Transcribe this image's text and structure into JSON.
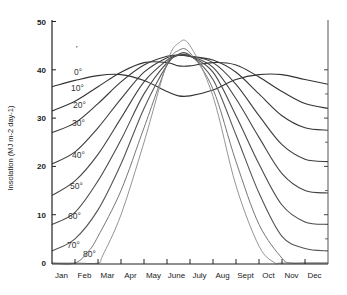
{
  "chart_data": {
    "type": "line",
    "title": "",
    "xlabel": "",
    "ylabel": "Insolation (MJ m-2 day-1)",
    "ylim": [
      0,
      50
    ],
    "yticks": [
      0,
      10,
      20,
      30,
      40,
      50
    ],
    "grid": false,
    "legend_position": "inline labels at left",
    "categories": [
      "Jan",
      "Feb",
      "Mar",
      "Apr",
      "May",
      "June",
      "July",
      "Aug",
      "Sept",
      "Oct",
      "Nov",
      "Dec"
    ],
    "x_note": "x values are month position (0 = start of Jan, 12 = end of Dec)",
    "series": [
      {
        "name": "0°",
        "x": [
          0,
          1,
          2,
          3,
          4,
          5,
          5.5,
          6,
          7,
          8,
          9,
          10,
          11,
          12
        ],
        "values": [
          36.5,
          37.8,
          38.8,
          39.0,
          37.8,
          35.5,
          34.6,
          34.6,
          35.8,
          38.0,
          39.0,
          39.0,
          38.0,
          37.0
        ]
      },
      {
        "name": "10°",
        "x": [
          0,
          1,
          2,
          3,
          4,
          5,
          5.5,
          6,
          7,
          8,
          9,
          10,
          11,
          12
        ],
        "values": [
          31.5,
          33.5,
          36.5,
          39.5,
          41.5,
          41.5,
          40.8,
          40.8,
          41.5,
          41.0,
          38.5,
          35.5,
          33.0,
          32.0
        ]
      },
      {
        "name": "20°",
        "x": [
          0,
          1,
          2,
          3,
          4,
          5,
          5.5,
          6,
          7,
          8,
          9,
          10,
          11,
          12
        ],
        "values": [
          27.0,
          29.0,
          33.0,
          37.5,
          41.0,
          42.8,
          43.0,
          42.8,
          42.0,
          39.5,
          35.0,
          30.5,
          28.0,
          27.5
        ]
      },
      {
        "name": "30°",
        "x": [
          0,
          1,
          2,
          3,
          4,
          5,
          5.5,
          6,
          7,
          8,
          9,
          10,
          11,
          12
        ],
        "values": [
          20.5,
          23.0,
          28.0,
          34.0,
          39.5,
          42.5,
          43.0,
          42.8,
          41.5,
          37.0,
          30.5,
          24.5,
          21.5,
          21.0
        ]
      },
      {
        "name": "40°",
        "x": [
          0,
          1,
          2,
          3,
          4,
          5,
          5.5,
          6,
          7,
          8,
          9,
          10,
          11,
          12
        ],
        "values": [
          14.0,
          17.0,
          22.5,
          30.0,
          37.5,
          42.0,
          43.0,
          42.8,
          40.5,
          34.0,
          26.0,
          18.5,
          15.0,
          14.5
        ]
      },
      {
        "name": "50°",
        "x": [
          0,
          1,
          2,
          3,
          4,
          5,
          5.5,
          6,
          7,
          8,
          9,
          10,
          11,
          12
        ],
        "values": [
          8.0,
          10.5,
          17.0,
          25.5,
          35.0,
          41.5,
          43.0,
          42.8,
          39.5,
          30.5,
          20.5,
          12.0,
          8.5,
          8.0
        ]
      },
      {
        "name": "60°",
        "x": [
          0,
          1,
          2,
          3,
          4,
          5,
          5.5,
          6,
          7,
          8,
          9,
          10,
          11,
          12
        ],
        "values": [
          2.5,
          5.0,
          11.0,
          20.5,
          32.0,
          41.0,
          43.2,
          43.0,
          38.0,
          26.5,
          14.5,
          5.5,
          3.0,
          2.5
        ]
      },
      {
        "name": "70°",
        "x": [
          0,
          1,
          1.6,
          2,
          3,
          4,
          5,
          5.5,
          6,
          7,
          8,
          9,
          10,
          10.4,
          11,
          12
        ],
        "values": [
          0,
          0,
          2.5,
          5.5,
          15.0,
          28.0,
          41.0,
          44.0,
          43.5,
          36.0,
          21.0,
          8.0,
          1.0,
          0,
          0,
          0
        ]
      },
      {
        "name": "80°",
        "x": [
          0,
          1,
          2,
          2.2,
          3,
          4,
          5,
          5.5,
          6,
          7,
          8,
          9,
          9.7,
          10,
          12
        ],
        "values": [
          0,
          0,
          0,
          1.5,
          10.0,
          25.0,
          41.5,
          45.5,
          45.0,
          34.5,
          16.0,
          3.5,
          0,
          0,
          0
        ]
      }
    ]
  },
  "axes": {
    "ylabel": "Insolation (MJ m-2 day-1)",
    "yticks": [
      "0",
      "10",
      "20",
      "30",
      "40",
      "50"
    ],
    "months": [
      "Jan",
      "Feb",
      "Mar",
      "Apr",
      "May",
      "June",
      "July",
      "Aug",
      "Sept",
      "Oct",
      "Nov",
      "Dec"
    ]
  },
  "latitude_labels": [
    "0°",
    "10°",
    "20°",
    "30°",
    "40°",
    "50°",
    "60°",
    "70°",
    "80°"
  ]
}
